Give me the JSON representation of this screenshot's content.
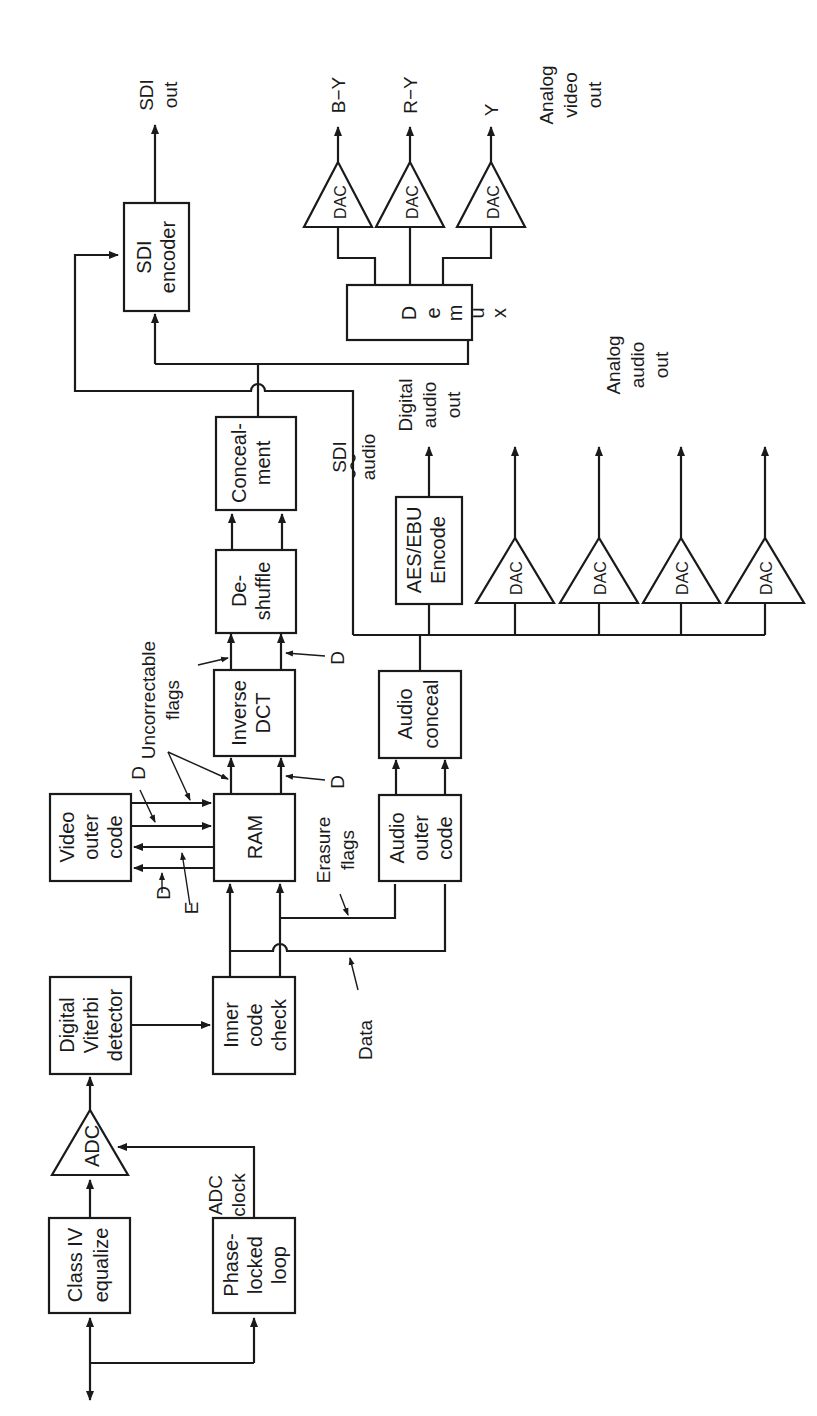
{
  "blocks": {
    "class_iv": [
      "Class IV",
      "equalize"
    ],
    "pll": [
      "Phase-",
      "locked",
      "loop"
    ],
    "adc": "ADC",
    "viterbi": [
      "Digital",
      "Viterbi",
      "detector"
    ],
    "inner": [
      "Inner",
      "code",
      "check"
    ],
    "video_outer": [
      "Video",
      "outer",
      "code"
    ],
    "ram": "RAM",
    "audio_outer": [
      "Audio",
      "outer",
      "code"
    ],
    "inverse_dct": [
      "Inverse",
      "DCT"
    ],
    "audio_conceal": [
      "Audio",
      "conceal"
    ],
    "deshuffle": [
      "De-",
      "shuffle"
    ],
    "aes_ebu": [
      "AES/EBU",
      "Encode"
    ],
    "concealment": [
      "Conceal-",
      "ment"
    ],
    "sdi_encoder": [
      "SDI",
      "encoder"
    ],
    "demux": [
      "D",
      "e",
      "m",
      "u",
      "x"
    ],
    "dac": "DAC"
  },
  "labels": {
    "adc_clock": [
      "ADC",
      "clock"
    ],
    "data": "Data",
    "erasure_flags": [
      "Erasure",
      "flags"
    ],
    "d": "D",
    "e": "E",
    "uncorrectable_flags": [
      "Uncorrectable",
      "flags"
    ],
    "sdi_audio": [
      "SDI",
      "audio"
    ],
    "digital_audio_out": [
      "Digital",
      "audio",
      "out"
    ],
    "analog_audio_out": [
      "Analog",
      "audio",
      "out"
    ],
    "sdi_out": [
      "SDI",
      "out"
    ],
    "b_y": "B−Y",
    "r_y": "R−Y",
    "y": "Y",
    "analog_video_out": [
      "Analog",
      "video",
      "out"
    ]
  },
  "colors": {
    "ink": "#1a1a1a",
    "background": "#ffffff"
  }
}
